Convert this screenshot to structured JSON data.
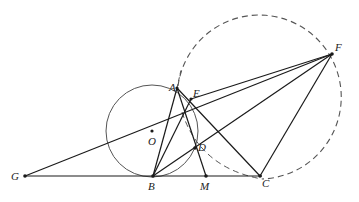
{
  "figure": {
    "colors": {
      "line": "#1a1a1a",
      "circle": "#555555",
      "dashed": "#555555",
      "background": "#ffffff"
    },
    "points": {
      "G": {
        "label": "G",
        "x": 25,
        "y": 176
      },
      "B": {
        "label": "B",
        "x": 153,
        "y": 176
      },
      "M": {
        "label": "M",
        "x": 206,
        "y": 176
      },
      "C": {
        "label": "C",
        "x": 260,
        "y": 176
      },
      "A": {
        "label": "A",
        "x": 177,
        "y": 88
      },
      "E": {
        "label": "E",
        "x": 191,
        "y": 99
      },
      "D": {
        "label": "D",
        "x": 195,
        "y": 148
      },
      "F": {
        "label": "F",
        "x": 332,
        "y": 54
      },
      "O": {
        "label": "O",
        "x": 152,
        "y": 131
      }
    },
    "circles": [
      {
        "name": "circle-O",
        "cx": 152,
        "cy": 131,
        "r": 46,
        "style": "solid"
      },
      {
        "name": "dashed-circle",
        "cx": 263,
        "cy": 97,
        "r": 82,
        "style": "dashed"
      }
    ],
    "segments": [
      [
        "G",
        "C"
      ],
      [
        "G",
        "F"
      ],
      [
        "A",
        "B"
      ],
      [
        "A",
        "C"
      ],
      [
        "A",
        "M"
      ],
      [
        "B",
        "E"
      ],
      [
        "B",
        "F"
      ],
      [
        "B",
        "D"
      ],
      [
        "C",
        "F"
      ],
      [
        "E",
        "F"
      ]
    ]
  }
}
